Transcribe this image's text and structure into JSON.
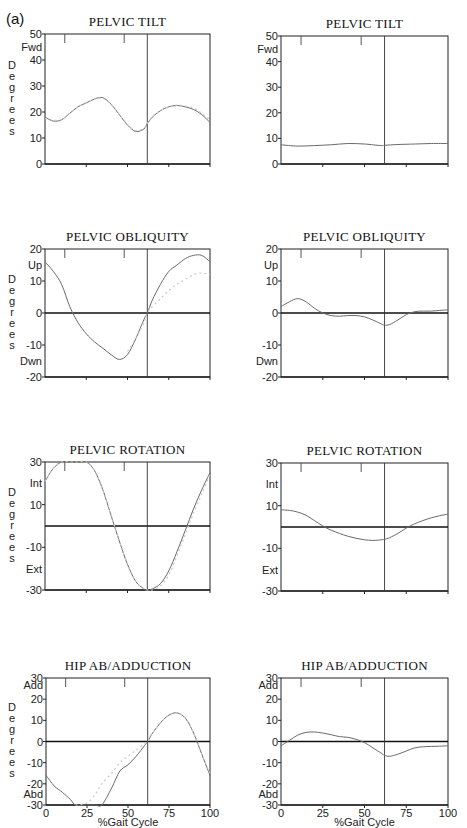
{
  "figure": {
    "panel_label": "(a)",
    "x_axis_label": "%Gait Cycle",
    "x_ticks": [
      "0",
      "25",
      "50",
      "75",
      "100"
    ],
    "y_axis_word": "Degrees",
    "colors": {
      "line": "#6a6a6a",
      "normal_band": "#c9c9c9",
      "axis": "#222222",
      "zero": "#111111",
      "toe_off": "#333333"
    }
  },
  "chart_data": [
    {
      "type": "line",
      "id": "tilt-left",
      "title": "PELVIC TILT",
      "column": "left",
      "xlabel": "",
      "ylabel": "Degrees",
      "ylim": [
        0,
        50
      ],
      "y_ticks": [
        0,
        10,
        20,
        30,
        40,
        50
      ],
      "y_dir_labels": {
        "top": "Fwd"
      },
      "zero_line": false,
      "toe_off_pct": 62,
      "x": [
        0,
        5,
        10,
        15,
        20,
        25,
        30,
        35,
        40,
        45,
        50,
        55,
        60,
        62,
        65,
        70,
        75,
        80,
        85,
        90,
        95,
        100
      ],
      "series": [
        {
          "name": "Patient",
          "values": [
            18,
            16.5,
            17,
            19.5,
            22,
            23.5,
            25,
            25.5,
            23,
            19,
            15,
            12.5,
            13.5,
            15.5,
            18,
            20.5,
            22,
            22.5,
            22,
            21,
            19,
            16
          ]
        },
        {
          "name": "Normal",
          "values": [
            17.5,
            16.8,
            17.2,
            19.6,
            22,
            23.6,
            25,
            25.2,
            23,
            19.2,
            15.2,
            12.8,
            13.8,
            15.6,
            18.2,
            20.6,
            22,
            22.6,
            22.3,
            21.5,
            19.5,
            17
          ]
        }
      ]
    },
    {
      "type": "line",
      "id": "tilt-right",
      "title": "PELVIC TILT",
      "column": "right",
      "xlabel": "",
      "ylabel": "",
      "ylim": [
        0,
        50
      ],
      "y_ticks": [
        0,
        10,
        20,
        30,
        40,
        50
      ],
      "y_dir_labels": {
        "top": "Fwd"
      },
      "zero_line": false,
      "toe_off_pct": 62,
      "x": [
        0,
        10,
        20,
        30,
        40,
        50,
        60,
        62,
        70,
        80,
        90,
        100
      ],
      "series": [
        {
          "name": "Patient",
          "values": [
            7.5,
            7,
            7.2,
            7.5,
            8,
            7.8,
            7.2,
            7.3,
            7.6,
            7.8,
            8,
            8
          ]
        }
      ]
    },
    {
      "type": "line",
      "id": "obliquity-left",
      "title": "PELVIC OBLIQUITY",
      "column": "left",
      "xlabel": "",
      "ylabel": "Degrees",
      "ylim": [
        -20,
        20
      ],
      "y_ticks": [
        -20,
        -10,
        0,
        10,
        20
      ],
      "y_dir_labels": {
        "top": "Up",
        "bottom": "Dwn"
      },
      "zero_line": true,
      "toe_off_pct": 62,
      "x": [
        0,
        5,
        10,
        15,
        20,
        25,
        30,
        35,
        40,
        45,
        50,
        55,
        60,
        62,
        65,
        70,
        75,
        80,
        85,
        90,
        95,
        100
      ],
      "series": [
        {
          "name": "Patient",
          "values": [
            16,
            13,
            9,
            2,
            -3,
            -6.5,
            -9,
            -11,
            -13,
            -14.5,
            -13,
            -8,
            -2,
            0,
            4,
            9,
            13,
            15,
            17,
            18,
            18,
            16
          ]
        },
        {
          "name": "Normal",
          "values": [
            null,
            null,
            null,
            null,
            null,
            null,
            null,
            null,
            null,
            null,
            -12,
            -8,
            -3,
            0,
            2,
            4.5,
            7,
            9,
            10.5,
            12,
            12.5,
            12
          ]
        }
      ]
    },
    {
      "type": "line",
      "id": "obliquity-right",
      "title": "PELVIC OBLIQUITY",
      "column": "right",
      "xlabel": "",
      "ylabel": "",
      "ylim": [
        -20,
        20
      ],
      "y_ticks": [
        -20,
        -10,
        0,
        10,
        20
      ],
      "y_dir_labels": {
        "top": "Up",
        "bottom": "Dwn"
      },
      "zero_line": true,
      "toe_off_pct": 62,
      "x": [
        0,
        5,
        10,
        15,
        20,
        25,
        30,
        35,
        40,
        45,
        50,
        55,
        60,
        62,
        65,
        70,
        75,
        80,
        85,
        90,
        95,
        100
      ],
      "series": [
        {
          "name": "Patient",
          "values": [
            2,
            3.5,
            4.5,
            3.5,
            1.5,
            0,
            -0.8,
            -1,
            -0.8,
            -0.8,
            -1.2,
            -2.2,
            -3.4,
            -3.8,
            -3.6,
            -2.2,
            -0.5,
            0.4,
            0.6,
            0.6,
            0.8,
            1
          ]
        }
      ]
    },
    {
      "type": "line",
      "id": "rotation-left",
      "title": "PELVIC ROTATION",
      "column": "left",
      "xlabel": "",
      "ylabel": "Degrees",
      "ylim": [
        -30,
        30
      ],
      "y_ticks": [
        -30,
        -10,
        10,
        30
      ],
      "y_dir_labels": {
        "top": "Int",
        "bottom": "Ext"
      },
      "zero_line": true,
      "toe_off_pct": 62,
      "x": [
        0,
        5,
        10,
        15,
        20,
        25,
        30,
        35,
        40,
        45,
        50,
        55,
        60,
        62,
        65,
        70,
        75,
        80,
        85,
        90,
        95,
        100
      ],
      "series": [
        {
          "name": "Patient",
          "values": [
            21,
            27,
            30,
            30,
            30,
            30,
            26,
            17,
            5,
            -7,
            -18,
            -26,
            -29.5,
            -30,
            -29.5,
            -27,
            -21,
            -12,
            -2,
            8,
            17,
            25
          ]
        },
        {
          "name": "Normal",
          "values": [
            21,
            27,
            30,
            30,
            30,
            30,
            26,
            17,
            5,
            -7,
            -18,
            -26,
            -29.5,
            -30,
            -30,
            -28,
            -23,
            -14,
            -4,
            6,
            15,
            24
          ]
        }
      ]
    },
    {
      "type": "line",
      "id": "rotation-right",
      "title": "PELVIC ROTATION",
      "column": "right",
      "xlabel": "",
      "ylabel": "",
      "ylim": [
        -30,
        30
      ],
      "y_ticks": [
        -30,
        -10,
        10,
        30
      ],
      "y_dir_labels": {
        "top": "Int",
        "bottom": "Ext"
      },
      "zero_line": true,
      "toe_off_pct": 62,
      "x": [
        0,
        5,
        10,
        15,
        20,
        25,
        30,
        35,
        40,
        45,
        50,
        55,
        60,
        62,
        65,
        70,
        75,
        80,
        85,
        90,
        95,
        100
      ],
      "series": [
        {
          "name": "Patient",
          "values": [
            8,
            7.8,
            7,
            5.5,
            3,
            0.5,
            -1.5,
            -3,
            -4.3,
            -5.3,
            -6,
            -6.3,
            -6,
            -5.8,
            -5,
            -3,
            -0.5,
            1.5,
            3,
            4.3,
            5.3,
            6
          ]
        }
      ]
    },
    {
      "type": "line",
      "id": "hip-left",
      "title": "HIP AB/ADDUCTION",
      "column": "left",
      "xlabel": "%Gait Cycle",
      "ylabel": "Degrees",
      "ylim": [
        -30,
        30
      ],
      "y_ticks": [
        -30,
        -20,
        -10,
        0,
        10,
        20,
        30
      ],
      "y_dir_labels": {
        "top": "Add",
        "bottom": "Abd"
      },
      "zero_line": true,
      "toe_off_pct": 62,
      "x_ticks": [
        0,
        25,
        50,
        75,
        100
      ],
      "x": [
        0,
        5,
        10,
        15,
        18,
        25,
        30,
        34,
        40,
        45,
        50,
        55,
        60,
        62,
        65,
        70,
        75,
        80,
        85,
        90,
        95,
        100
      ],
      "series": [
        {
          "name": "Patient",
          "values": [
            -16,
            -21,
            -24,
            -27.5,
            -30,
            -30,
            -30,
            -30,
            -22,
            -14,
            -11,
            -7,
            -2,
            0,
            4,
            9,
            12.5,
            13.5,
            11,
            4,
            -6,
            -16
          ]
        },
        {
          "name": "Normal",
          "values": [
            null,
            null,
            null,
            null,
            -30,
            -29,
            -25,
            -20,
            -15,
            -10,
            -7,
            -4,
            -1,
            0,
            4,
            9,
            12.5,
            13.5,
            11,
            4,
            -6,
            -15
          ]
        }
      ]
    },
    {
      "type": "line",
      "id": "hip-right",
      "title": "HIP AB/ADDUCTION",
      "column": "right",
      "xlabel": "%Gait Cycle",
      "ylabel": "",
      "ylim": [
        -30,
        30
      ],
      "y_ticks": [
        -30,
        -20,
        -10,
        0,
        10,
        20,
        30
      ],
      "y_dir_labels": {
        "top": "Add",
        "bottom": "Abd"
      },
      "zero_line": true,
      "toe_off_pct": 62,
      "x_ticks": [
        0,
        25,
        50,
        75,
        100
      ],
      "x": [
        0,
        5,
        10,
        15,
        20,
        25,
        30,
        35,
        40,
        45,
        50,
        55,
        60,
        62,
        65,
        70,
        75,
        80,
        85,
        90,
        95,
        100
      ],
      "series": [
        {
          "name": "Patient",
          "values": [
            -2,
            0.5,
            3,
            4.3,
            4.5,
            4,
            3.2,
            2.3,
            2,
            1,
            -0.5,
            -3,
            -5.5,
            -6.5,
            -7,
            -6,
            -4.5,
            -3,
            -2.5,
            -2.3,
            -2.2,
            -2
          ]
        }
      ]
    }
  ],
  "layout": {
    "boxes": {
      "tilt-left": [
        45,
        34,
        210,
        164
      ],
      "tilt-right": [
        281,
        36,
        448,
        164
      ],
      "obliquity-left": [
        45,
        249,
        210,
        377
      ],
      "obliquity-right": [
        281,
        249,
        448,
        377
      ],
      "rotation-left": [
        45,
        462,
        210,
        590
      ],
      "rotation-right": [
        281,
        463,
        448,
        591
      ],
      "hip-left": [
        46,
        678,
        210,
        805
      ],
      "hip-right": [
        281,
        678,
        448,
        805
      ]
    }
  }
}
